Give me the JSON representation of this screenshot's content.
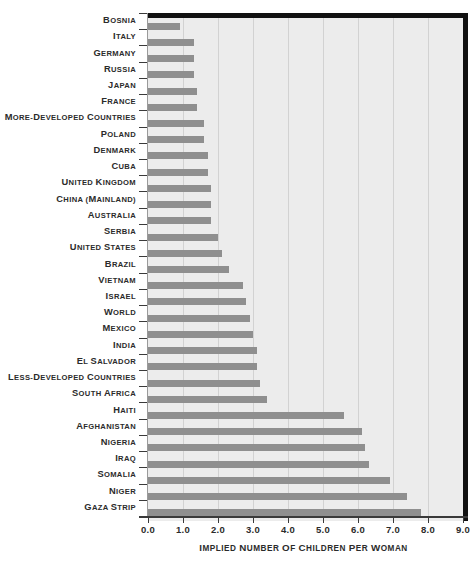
{
  "chart_data": {
    "type": "bar",
    "orientation": "horizontal",
    "title": "",
    "xlabel": "Implied Number of Children per Woman",
    "ylabel": "",
    "xlim": [
      0.0,
      9.0
    ],
    "xticks": [
      "0.0",
      "1.0",
      "2.0",
      "3.0",
      "4.0",
      "5.0",
      "6.0",
      "7.0",
      "8.0",
      "9.0"
    ],
    "grid": "vertical",
    "legend": "none",
    "bar_color": "#8f8f8f",
    "plot_background": "#ececec",
    "categories": [
      "Bosnia",
      "Italy",
      "Germany",
      "Russia",
      "Japan",
      "France",
      "More-Developed Countries",
      "Poland",
      "Denmark",
      "Cuba",
      "United Kingdom",
      "China (mainland)",
      "Australia",
      "Serbia",
      "United States",
      "Brazil",
      "Vietnam",
      "Israel",
      "World",
      "Mexico",
      "India",
      "El Salvador",
      "Less-Developed Countries",
      "South Africa",
      "Haiti",
      "Afghanistan",
      "Nigeria",
      "Iraq",
      "Somalia",
      "Niger",
      "Gaza Strip"
    ],
    "values": [
      0.9,
      1.3,
      1.3,
      1.3,
      1.4,
      1.4,
      1.6,
      1.6,
      1.7,
      1.7,
      1.8,
      1.8,
      1.8,
      2.0,
      2.1,
      2.3,
      2.7,
      2.8,
      2.9,
      3.0,
      3.1,
      3.1,
      3.2,
      3.4,
      5.6,
      6.1,
      6.2,
      6.3,
      6.9,
      7.4,
      7.8
    ]
  }
}
